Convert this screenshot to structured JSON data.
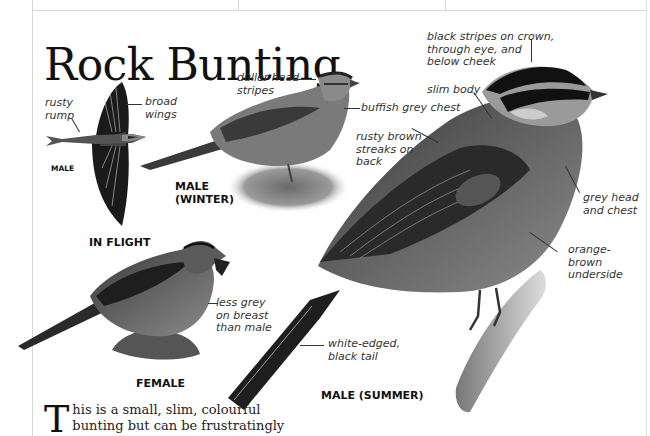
{
  "title": "Rock Bunting",
  "figures": {
    "in_flight": {
      "caption": "IN FLIGHT",
      "sex_label": "MALE",
      "labels": [
        "rusty rump",
        "broad wings"
      ]
    },
    "male_winter": {
      "caption": "MALE (WINTER)",
      "caption_lines": [
        "MALE",
        "(WINTER)"
      ],
      "labels": [
        "duller head stripes",
        "buffish grey chest"
      ]
    },
    "female": {
      "caption": "FEMALE",
      "labels": [
        "less grey on breast than male"
      ]
    },
    "male_summer": {
      "caption": "MALE (SUMMER)",
      "labels": [
        "black stripes on crown, through eye, and below cheek",
        "slim body",
        "rusty brown streaks on back",
        "grey head and chest",
        "orange-brown underside",
        "white-edged, black tail"
      ]
    }
  },
  "label_lines": {
    "rusty_rump": [
      "rusty",
      "rump"
    ],
    "broad_wings": [
      "broad",
      "wings"
    ],
    "duller_head": [
      "duller head",
      "stripes"
    ],
    "buffish": [
      "buffish grey chest"
    ],
    "black_stripes": [
      "black stripes on crown,",
      "through eye, and",
      "below cheek"
    ],
    "slim_body": [
      "slim body"
    ],
    "rusty_brown": [
      "rusty brown",
      "streaks on",
      "back"
    ],
    "grey_head": [
      "grey head",
      "and chest"
    ],
    "orange_brown": [
      "orange-",
      "brown",
      "underside"
    ],
    "less_grey": [
      "less grey",
      "on breast",
      "than male"
    ],
    "white_edged": [
      "white-edged,",
      "black tail"
    ]
  },
  "intro": {
    "dropcap": "T",
    "text": "his is a small, slim, colourful bunting but can be frustratingly"
  },
  "colors": {
    "text": "#111111",
    "label": "#333333",
    "rule": "#d6d6d6"
  }
}
